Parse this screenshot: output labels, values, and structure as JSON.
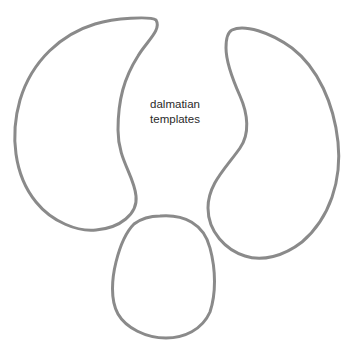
{
  "caption": {
    "line1": "dalmatian",
    "line2": "templates"
  },
  "colors": {
    "background": "#ffffff",
    "stroke": "#8a8a8a",
    "text": "#2a2a2a"
  },
  "shapes": [
    {
      "name": "left-ear-template",
      "description": "large paisley/teardrop outline, left"
    },
    {
      "name": "right-ear-template",
      "description": "large kidney/paisley outline, right"
    },
    {
      "name": "nose-template",
      "description": "rounded egg-shaped outline, bottom center"
    }
  ]
}
